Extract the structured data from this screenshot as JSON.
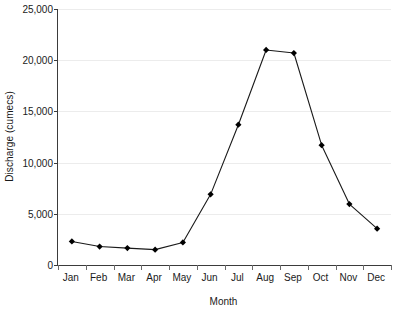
{
  "chart_data": {
    "type": "line",
    "title": "",
    "xlabel": "Month",
    "ylabel": "Discharge (cumecs)",
    "categories": [
      "Jan",
      "Feb",
      "Mar",
      "Apr",
      "May",
      "Jun",
      "Jul",
      "Aug",
      "Sep",
      "Oct",
      "Nov",
      "Dec"
    ],
    "values": [
      2300,
      1800,
      1650,
      1500,
      2200,
      6900,
      13700,
      21000,
      20700,
      11700,
      5950,
      3550
    ],
    "series": [
      {
        "name": "Discharge",
        "values": [
          2300,
          1800,
          1650,
          1500,
          2200,
          6900,
          13700,
          21000,
          20700,
          11700,
          5950,
          3550
        ]
      }
    ],
    "ylim": [
      0,
      25000
    ],
    "ytick_values": [
      0,
      5000,
      10000,
      15000,
      20000,
      25000
    ],
    "ytick_labels": [
      "0",
      "5,000",
      "10,000",
      "15,000",
      "20,000",
      "25,000"
    ],
    "grid": true,
    "grid_axis": "y",
    "legend": false,
    "legend_position": "none",
    "marker": "diamond",
    "line_color": "#1a1a1a",
    "marker_color": "#000000",
    "grid_color": "#ececec",
    "axis_color": "#3b3b3b",
    "background_color": "#ffffff"
  }
}
